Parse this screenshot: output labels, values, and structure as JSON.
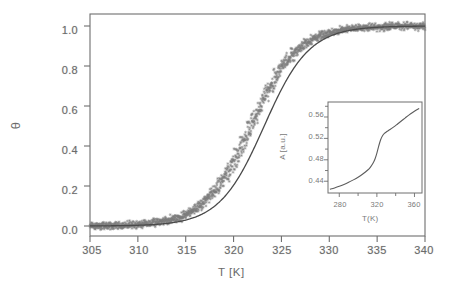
{
  "figure": {
    "background_color": "#ffffff",
    "axis_color": "#6e6e6e",
    "data_color": "#7d7d7d",
    "fit_color": "#4a4a4a"
  },
  "main_axes": {
    "x_title": "T [K]",
    "y_title": "θ",
    "x_ticks": [
      "305",
      "310",
      "315",
      "320",
      "325",
      "330",
      "335",
      "340"
    ],
    "y_ticks": [
      "0.0",
      "0.2",
      "0.4",
      "0.6",
      "0.8",
      "1.0"
    ]
  },
  "inset_axes": {
    "x_title": "T(K)",
    "y_title": "A [a.u.]",
    "x_ticks": [
      "280",
      "320",
      "360"
    ],
    "y_ticks": [
      "0.44",
      "0.48",
      "0.52",
      "0.56"
    ]
  },
  "chart_data": [
    {
      "type": "scatter",
      "name": "main",
      "title": "",
      "xlabel": "T [K]",
      "ylabel": "θ",
      "xlim": [
        305,
        340
      ],
      "ylim": [
        -0.05,
        1.06
      ],
      "xticks": [
        305,
        310,
        315,
        320,
        325,
        330,
        335,
        340
      ],
      "yticks": [
        0.0,
        0.2,
        0.4,
        0.6,
        0.8,
        1.0
      ],
      "grid": false,
      "legend": "none",
      "series": [
        {
          "name": "experimental data",
          "marker": "star",
          "color": "#7d7d7d",
          "description": "dense noisy sigmoid scatter cloud, noise amplitude about 0.035, transition midpoint 321.8 K, width 2.45 K",
          "model": "sigmoid",
          "midpoint": 321.8,
          "width": 2.45,
          "noise": 0.035,
          "n_points": 1500,
          "x": [
            305.0,
            306.0,
            307.0,
            308.0,
            309.0,
            310.0,
            311.0,
            312.0,
            313.0,
            314.0,
            315.0,
            316.0,
            317.0,
            318.0,
            319.0,
            320.0,
            321.0,
            322.0,
            323.0,
            324.0,
            325.0,
            326.0,
            327.0,
            328.0,
            329.0,
            330.0,
            332.0,
            334.0,
            336.0,
            338.0,
            340.0
          ],
          "y": [
            0.001,
            0.002,
            0.003,
            0.004,
            0.006,
            0.009,
            0.014,
            0.021,
            0.032,
            0.049,
            0.073,
            0.108,
            0.158,
            0.224,
            0.308,
            0.408,
            0.519,
            0.628,
            0.726,
            0.806,
            0.867,
            0.911,
            0.942,
            0.962,
            0.975,
            0.984,
            0.993,
            0.997,
            0.999,
            1.0,
            1.0
          ]
        },
        {
          "name": "model fit",
          "marker": "none",
          "color": "#4a4a4a",
          "description": "smooth solid sigmoid curve shifted slightly to higher temperature relative to the scatter",
          "model": "sigmoid",
          "midpoint": 323.2,
          "width": 2.35,
          "x": [
            305.0,
            307.0,
            309.0,
            311.0,
            313.0,
            315.0,
            316.0,
            317.0,
            318.0,
            319.0,
            320.0,
            321.0,
            322.0,
            323.0,
            324.0,
            325.0,
            326.0,
            327.0,
            328.0,
            329.0,
            330.0,
            332.0,
            334.0,
            336.0,
            338.0,
            340.0
          ],
          "y": [
            0.0005,
            0.0012,
            0.0029,
            0.0068,
            0.016,
            0.037,
            0.056,
            0.084,
            0.124,
            0.179,
            0.251,
            0.339,
            0.44,
            0.543,
            0.641,
            0.727,
            0.797,
            0.85,
            0.892,
            0.921,
            0.943,
            0.97,
            0.985,
            0.992,
            0.996,
            0.998
          ]
        }
      ]
    },
    {
      "type": "line",
      "name": "inset",
      "title": "",
      "xlabel": "T(K)",
      "ylabel": "A [a.u.]",
      "xlim": [
        268,
        368
      ],
      "ylim": [
        0.418,
        0.588
      ],
      "xticks": [
        280,
        320,
        360
      ],
      "yticks": [
        0.44,
        0.48,
        0.52,
        0.56
      ],
      "grid": false,
      "legend": "none",
      "series": [
        {
          "name": "A(T)",
          "color": "#5c5c5c",
          "description": "gradual rise with a pronounced step near 320 K then a shallower continued rise",
          "x": [
            270,
            275,
            280,
            285,
            290,
            295,
            300,
            305,
            310,
            313,
            316,
            318,
            320,
            322,
            324,
            326,
            328,
            330,
            334,
            338,
            342,
            346,
            350,
            354,
            358,
            362,
            365
          ],
          "y": [
            0.425,
            0.4275,
            0.4305,
            0.434,
            0.438,
            0.4425,
            0.4475,
            0.4535,
            0.4605,
            0.466,
            0.474,
            0.4815,
            0.4925,
            0.506,
            0.5175,
            0.525,
            0.5295,
            0.532,
            0.5365,
            0.5415,
            0.547,
            0.5525,
            0.558,
            0.5635,
            0.5685,
            0.573,
            0.576
          ]
        }
      ]
    }
  ]
}
